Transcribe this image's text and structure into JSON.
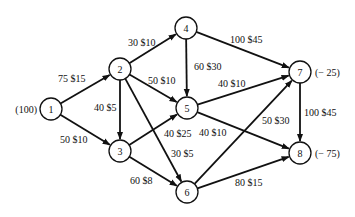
{
  "diagram": {
    "type": "network-flow",
    "nodes": [
      {
        "id": "1",
        "x": 51,
        "y": 109,
        "supply": "(100)",
        "supply_side": "left"
      },
      {
        "id": "2",
        "x": 120,
        "y": 69,
        "supply": ""
      },
      {
        "id": "3",
        "x": 120,
        "y": 151,
        "supply": ""
      },
      {
        "id": "4",
        "x": 186,
        "y": 28,
        "supply": ""
      },
      {
        "id": "5",
        "x": 187,
        "y": 108,
        "supply": ""
      },
      {
        "id": "6",
        "x": 187,
        "y": 192,
        "supply": ""
      },
      {
        "id": "7",
        "x": 300,
        "y": 72,
        "supply": "(− 25)",
        "supply_side": "right"
      },
      {
        "id": "8",
        "x": 300,
        "y": 153,
        "supply": "(− 75)",
        "supply_side": "right"
      }
    ],
    "edges": [
      {
        "from": "1",
        "to": "2",
        "label": "75 $15",
        "lx": 58,
        "ly": 82
      },
      {
        "from": "1",
        "to": "3",
        "label": "50 $10",
        "lx": 60,
        "ly": 143
      },
      {
        "from": "2",
        "to": "4",
        "label": "30 $10",
        "lx": 128,
        "ly": 46
      },
      {
        "from": "2",
        "to": "5",
        "label": "50 $10",
        "lx": 148,
        "ly": 84
      },
      {
        "from": "2",
        "to": "3",
        "label": "40 $5",
        "lx": 94,
        "ly": 111
      },
      {
        "from": "2",
        "to": "6",
        "label": "30 $5",
        "lx": 171,
        "ly": 157
      },
      {
        "from": "3",
        "to": "5",
        "label": "40 $25",
        "lx": 164,
        "ly": 137
      },
      {
        "from": "3",
        "to": "6",
        "label": "60 $8",
        "lx": 130,
        "ly": 184
      },
      {
        "from": "4",
        "to": "7",
        "label": "100 $45",
        "lx": 230,
        "ly": 43
      },
      {
        "from": "4",
        "to": "5",
        "label": "60 $30",
        "lx": 194,
        "ly": 70
      },
      {
        "from": "5",
        "to": "7",
        "label": "40 $10",
        "lx": 218,
        "ly": 87
      },
      {
        "from": "5",
        "to": "8",
        "label": "40 $10",
        "lx": 199,
        "ly": 136
      },
      {
        "from": "6",
        "to": "7",
        "label": "50 $30",
        "lx": 262,
        "ly": 124
      },
      {
        "from": "6",
        "to": "8",
        "label": "80 $15",
        "lx": 235,
        "ly": 186
      },
      {
        "from": "7",
        "to": "8",
        "label": "100 $45",
        "lx": 304,
        "ly": 116
      }
    ]
  }
}
